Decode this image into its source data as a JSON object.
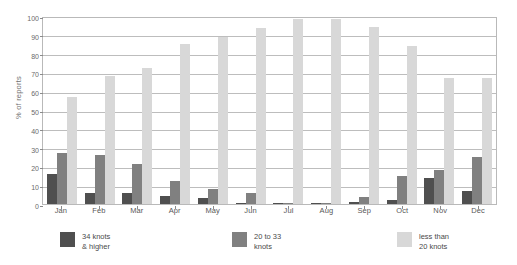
{
  "chart_data": {
    "type": "bar",
    "title": "",
    "subtitle": "",
    "xlabel": "",
    "ylabel": "% of reports",
    "ylim": [
      0,
      100
    ],
    "yticks": [
      0,
      10,
      20,
      30,
      40,
      50,
      60,
      70,
      80,
      90,
      100
    ],
    "grid": true,
    "legend_position": "bottom",
    "categories": [
      "Jan",
      "Feb",
      "Mar",
      "Apr",
      "May",
      "Jun",
      "Jul",
      "Aug",
      "Sep",
      "Oct",
      "Nov",
      "Dec"
    ],
    "series": [
      {
        "name": "34 knots\n& higher",
        "color": "#4f4f4f",
        "values": [
          16,
          6,
          6,
          4,
          3,
          0.5,
          0.5,
          0.5,
          1,
          2,
          14,
          7
        ]
      },
      {
        "name": "20 to 33\nknots",
        "color": "#808080",
        "values": [
          27,
          26,
          21.5,
          12,
          8,
          6,
          0.5,
          0.5,
          3.5,
          15,
          18,
          25
        ]
      },
      {
        "name": "less than\n20 knots",
        "color": "#d8d8d8",
        "values": [
          57,
          68,
          72.5,
          85,
          89,
          93.5,
          98.5,
          98.5,
          94,
          84,
          67,
          67
        ]
      }
    ]
  },
  "legend": {
    "items": [
      {
        "label": "34 knots\n& higher",
        "color": "#4f4f4f"
      },
      {
        "label": "20 to 33\nknots",
        "color": "#808080"
      },
      {
        "label": "less than\n20 knots",
        "color": "#d8d8d8"
      }
    ]
  }
}
